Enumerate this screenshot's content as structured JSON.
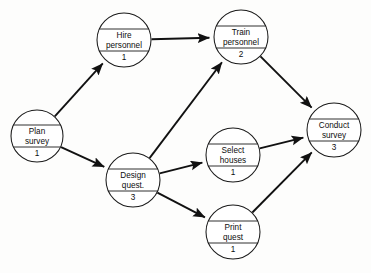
{
  "diagram": {
    "type": "activity-on-node-network",
    "nodes": [
      {
        "id": "plan-survey",
        "line1": "Plan",
        "line2": "survey",
        "duration": "1",
        "cx": 37,
        "cy": 136,
        "r": 26
      },
      {
        "id": "hire-personnel",
        "line1": "Hire",
        "line2": "personnel",
        "duration": "1",
        "cx": 124,
        "cy": 40,
        "r": 27
      },
      {
        "id": "train-personnel",
        "line1": "Train",
        "line2": "personnel",
        "duration": "2",
        "cx": 241,
        "cy": 37,
        "r": 27
      },
      {
        "id": "design-quest",
        "line1": "Design",
        "line2": "quest.",
        "duration": "3",
        "cx": 133,
        "cy": 180,
        "r": 27
      },
      {
        "id": "select-houses",
        "line1": "Select",
        "line2": "houses",
        "duration": "1",
        "cx": 233,
        "cy": 155,
        "r": 27
      },
      {
        "id": "print-quest",
        "line1": "Print",
        "line2": "quest",
        "duration": "1",
        "cx": 233,
        "cy": 232,
        "r": 27
      },
      {
        "id": "conduct-survey",
        "line1": "Conduct",
        "line2": "survey",
        "duration": "3",
        "cx": 334,
        "cy": 130,
        "r": 27
      }
    ],
    "edges": [
      {
        "id": "plan-to-hire",
        "from": "plan-survey",
        "to": "hire-personnel"
      },
      {
        "id": "plan-to-design",
        "from": "plan-survey",
        "to": "design-quest"
      },
      {
        "id": "hire-to-train",
        "from": "hire-personnel",
        "to": "train-personnel"
      },
      {
        "id": "design-to-train",
        "from": "design-quest",
        "to": "train-personnel"
      },
      {
        "id": "design-to-select",
        "from": "design-quest",
        "to": "select-houses"
      },
      {
        "id": "design-to-print",
        "from": "design-quest",
        "to": "print-quest"
      },
      {
        "id": "train-to-conduct",
        "from": "train-personnel",
        "to": "conduct-survey"
      },
      {
        "id": "select-to-conduct",
        "from": "select-houses",
        "to": "conduct-survey"
      },
      {
        "id": "print-to-conduct",
        "from": "print-quest",
        "to": "conduct-survey"
      }
    ],
    "colors": {
      "stroke": "#111111",
      "node_fill": "#ffffff",
      "background": "#fdfdfc",
      "text": "#0d0d0d"
    }
  }
}
